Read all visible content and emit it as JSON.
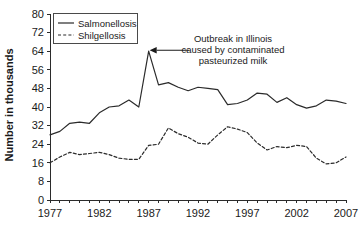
{
  "chart_data": {
    "type": "line",
    "title": "",
    "xlabel": "",
    "ylabel": "Number in thousands",
    "xlim": [
      1977,
      2007
    ],
    "ylim": [
      0,
      80
    ],
    "grid": false,
    "legend_position": "top-left",
    "x": [
      1977,
      1978,
      1979,
      1980,
      1981,
      1982,
      1983,
      1984,
      1985,
      1986,
      1987,
      1988,
      1989,
      1990,
      1991,
      1992,
      1993,
      1994,
      1995,
      1996,
      1997,
      1998,
      1999,
      2000,
      2001,
      2002,
      2003,
      2004,
      2005,
      2006,
      2007
    ],
    "xtick_labels": [
      "1977",
      "1982",
      "1987",
      "1992",
      "1997",
      "2002",
      "2007"
    ],
    "xticks": [
      1977,
      1982,
      1987,
      1992,
      1997,
      2002,
      2007
    ],
    "yticks": [
      0,
      8,
      16,
      24,
      32,
      40,
      48,
      56,
      64,
      72,
      80
    ],
    "ytick_labels": [
      "0",
      "8",
      "16",
      "24",
      "32",
      "40",
      "48",
      "56",
      "64",
      "72",
      "80"
    ],
    "series": [
      {
        "name": "Salmonellosis",
        "style": "solid",
        "values": [
          28.0,
          29.5,
          33.0,
          33.5,
          33.0,
          37.5,
          40.0,
          40.5,
          43.0,
          40.0,
          64.0,
          49.5,
          50.5,
          48.5,
          47.0,
          48.5,
          48.0,
          47.5,
          41.0,
          41.5,
          43.0,
          46.0,
          45.5,
          42.0,
          44.0,
          41.0,
          39.5,
          40.5,
          43.0,
          42.5,
          41.5
        ]
      },
      {
        "name": "Shilgellosis",
        "style": "dashed",
        "values": [
          16.0,
          18.5,
          20.5,
          19.5,
          20.0,
          20.5,
          19.5,
          18.0,
          17.5,
          17.5,
          23.5,
          24.0,
          31.0,
          28.5,
          27.0,
          24.5,
          24.0,
          28.0,
          31.5,
          30.5,
          29.0,
          24.5,
          21.5,
          23.0,
          22.5,
          23.5,
          23.0,
          18.0,
          15.5,
          16.0,
          18.5
        ]
      }
    ],
    "annotations": [
      {
        "name": "outbreak-annotation",
        "lines": [
          "Outbreak in Illinois",
          "caused by contaminated",
          "pasteurized milk"
        ],
        "points_to_year": 1987,
        "points_to_value": 64
      }
    ]
  },
  "legend": {
    "entries": [
      {
        "label": "Salmonellosis",
        "style": "solid"
      },
      {
        "label": "Shilgellosis",
        "style": "dashed"
      }
    ]
  }
}
